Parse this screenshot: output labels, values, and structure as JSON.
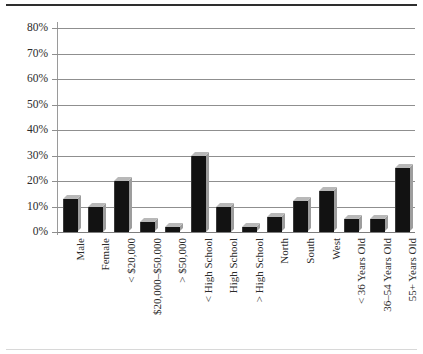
{
  "chart_data": {
    "type": "bar",
    "title": "",
    "subtitle": "",
    "xlabel": "",
    "ylabel": "",
    "ylim": [
      0,
      0.8
    ],
    "grid": true,
    "legend": "none",
    "y_ticks": [
      "0%",
      "10%",
      "20%",
      "30%",
      "40%",
      "50%",
      "60%",
      "70%",
      "80%"
    ],
    "y_tick_values": [
      0,
      10,
      20,
      30,
      40,
      50,
      60,
      70,
      80
    ],
    "categories": [
      "Male",
      "Female",
      "< $20,000",
      "$20,000–$50,000",
      "> $50,000",
      "< High School",
      "High School",
      "> High School",
      "North",
      "South",
      "West",
      "< 36 Years Old",
      "36–54 Years Old",
      "55+ Years Old"
    ],
    "values": [
      13,
      10,
      20,
      4,
      2,
      30,
      10,
      2,
      6,
      12,
      16,
      5,
      5,
      25
    ],
    "value_labels": [
      "13%",
      "10%",
      "20%",
      "4%",
      "2%",
      "30%",
      "10%",
      "2%",
      "6%",
      "12%",
      "16%",
      "5%",
      "5%",
      "25%"
    ],
    "bar_color": "#121212",
    "bar_top_color": "#b8b8b8",
    "bar_side_color": "#9d9d9d",
    "grid_color": "#8f8f8f",
    "axis_color": "#9a9a9a",
    "text_color": "#2b2b2b",
    "background": "#ffffff"
  }
}
